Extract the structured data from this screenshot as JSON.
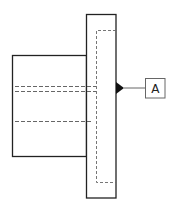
{
  "diagram": {
    "type": "engineering-drawing",
    "datum_label": "A",
    "colors": {
      "outline": "#222222",
      "hidden_line": "#555555",
      "datum_box": "#555555",
      "background": "#ffffff"
    }
  }
}
